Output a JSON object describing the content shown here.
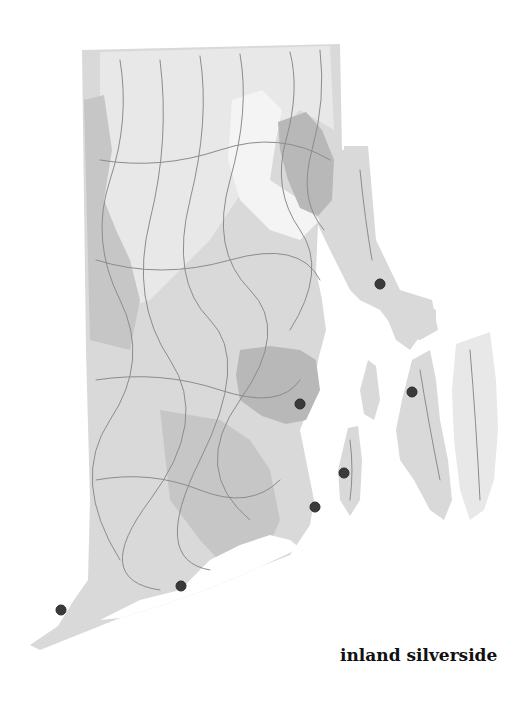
{
  "map": {
    "region": "Rhode Island",
    "species_label": "inland silverside",
    "colors": {
      "background": "#ffffff",
      "land": "#d9d9d9",
      "light_zone": "#e8e8e8",
      "dark_zone": "#b8b8b8",
      "rivers": "#8c8c8c",
      "occurrence_dot": "#3a3a3a"
    },
    "occurrences": [
      {
        "x": 380,
        "y": 284
      },
      {
        "x": 300,
        "y": 404
      },
      {
        "x": 412,
        "y": 392
      },
      {
        "x": 344,
        "y": 473
      },
      {
        "x": 315,
        "y": 507
      },
      {
        "x": 181,
        "y": 586
      },
      {
        "x": 61,
        "y": 610
      }
    ]
  }
}
